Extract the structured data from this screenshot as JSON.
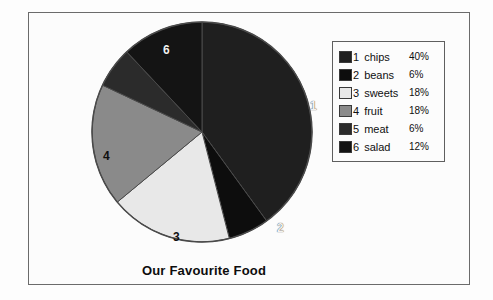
{
  "chart_data": {
    "type": "pie",
    "title": "Our Favourite Food",
    "xlabel": "",
    "ylabel": "",
    "legend_position": "right",
    "grid": false,
    "categories": [
      "chips",
      "beans",
      "sweets",
      "fruit",
      "meat",
      "salad"
    ],
    "values": [
      40,
      6,
      18,
      18,
      6,
      12
    ],
    "unit": "%",
    "slice_numbers": [
      "1",
      "2",
      "3",
      "4",
      "5",
      "6"
    ],
    "slice_labels_on_pie": [
      {
        "number": "1",
        "category": "chips",
        "value": 40
      },
      {
        "number": "2",
        "category": "beans",
        "value": 6
      },
      {
        "number": "3",
        "category": "sweets",
        "value": 18
      },
      {
        "number": "4",
        "category": "fruit",
        "value": 18
      },
      {
        "number": "5",
        "category": "meat",
        "value": 6
      },
      {
        "number": "6",
        "category": "salad",
        "value": 12
      }
    ],
    "colors": [
      "#1f1f1f",
      "#0d0d0d",
      "#e8e8e8",
      "#8a8a8a",
      "#2b2b2b",
      "#141414"
    ]
  },
  "chart": {
    "title": "Our Favourite Food"
  },
  "legend": {
    "rows": [
      {
        "number": "1",
        "name": "chips",
        "percent": "40%",
        "color": "#1f1f1f"
      },
      {
        "number": "2",
        "name": "beans",
        "percent": "6%",
        "color": "#0d0d0d"
      },
      {
        "number": "3",
        "name": "sweets",
        "percent": "18%",
        "color": "#e8e8e8"
      },
      {
        "number": "4",
        "name": "fruit",
        "percent": "18%",
        "color": "#8a8a8a"
      },
      {
        "number": "5",
        "name": "meat",
        "percent": "6%",
        "color": "#2b2b2b"
      },
      {
        "number": "6",
        "name": "salad",
        "percent": "12%",
        "color": "#141414"
      }
    ]
  },
  "pie_labels": {
    "one": "1",
    "two": "2",
    "three": "3",
    "four": "4",
    "six": "6"
  }
}
